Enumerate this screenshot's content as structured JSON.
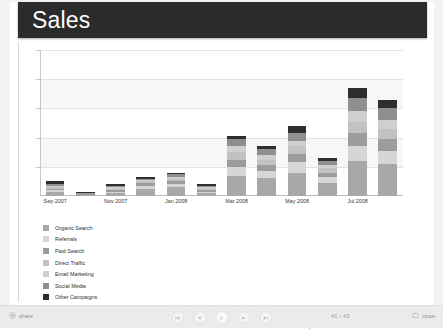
{
  "slide": {
    "title": "Sales"
  },
  "chart_data": {
    "type": "bar",
    "stacked": true,
    "title": "Sales",
    "xlabel": "",
    "ylabel": "",
    "grid": true,
    "legend_position": "bottom-left",
    "ylim": [
      0,
      100
    ],
    "categories": [
      "Sep 2007",
      "Oct 2007",
      "Nov 2007",
      "Dec 2007",
      "Jan 2008",
      "Feb 2008",
      "Mar 2008",
      "Apr 2008",
      "May 2008",
      "Jun 2008",
      "Jul 2008",
      "Aug 2008"
    ],
    "tick_labels": [
      "Sep 2007",
      "Nov 2007",
      "Jan 2008",
      "Mar 2008",
      "May 2008",
      "Jul 2008"
    ],
    "tick_indices": [
      0,
      2,
      4,
      6,
      8,
      10
    ],
    "series": [
      {
        "name": "Organic Search",
        "color": "#a8a8a8",
        "values": [
          3,
          1,
          2,
          5,
          6,
          2,
          14,
          12,
          16,
          9,
          24,
          22
        ]
      },
      {
        "name": "Referrals",
        "color": "#d6d6d6",
        "values": [
          1,
          0,
          1,
          2,
          2,
          1,
          6,
          5,
          7,
          4,
          10,
          9
        ]
      },
      {
        "name": "Paid Search",
        "color": "#9c9c9c",
        "values": [
          1,
          1,
          1,
          2,
          2,
          1,
          5,
          4,
          6,
          3,
          9,
          8
        ]
      },
      {
        "name": "Direct Traffic",
        "color": "#c2c2c2",
        "values": [
          1,
          0,
          1,
          1,
          2,
          1,
          5,
          4,
          5,
          3,
          8,
          7
        ]
      },
      {
        "name": "Email Marketing",
        "color": "#cfcfcf",
        "values": [
          1,
          0,
          1,
          1,
          1,
          1,
          4,
          3,
          4,
          2,
          7,
          6
        ]
      },
      {
        "name": "Social Media",
        "color": "#8f8f8f",
        "values": [
          1,
          0,
          1,
          1,
          2,
          1,
          5,
          4,
          5,
          3,
          9,
          8
        ]
      },
      {
        "name": "Other Campaigns",
        "color": "#2e2e2e",
        "values": [
          2,
          1,
          1,
          1,
          1,
          1,
          2,
          2,
          5,
          2,
          7,
          6
        ]
      }
    ]
  },
  "toolbar": {
    "share_label": "share",
    "page_counter": "41 / 43",
    "close_label": "close",
    "nav": {
      "first": "first-slide",
      "previous": "previous-slide",
      "play": "play",
      "next": "next-slide",
      "last": "last-slide"
    }
  }
}
